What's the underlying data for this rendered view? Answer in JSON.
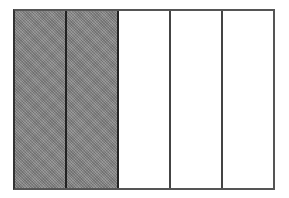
{
  "diagram": {
    "type": "fraction-bar",
    "total_parts": 5,
    "shaded_parts": 2,
    "fraction": "2/5",
    "colors": {
      "shaded": "#8a8a8a",
      "unshaded": "#ffffff",
      "border": "#444444"
    },
    "cells": [
      {
        "index": 0,
        "shaded": true
      },
      {
        "index": 1,
        "shaded": true
      },
      {
        "index": 2,
        "shaded": false
      },
      {
        "index": 3,
        "shaded": false
      },
      {
        "index": 4,
        "shaded": false
      }
    ]
  }
}
